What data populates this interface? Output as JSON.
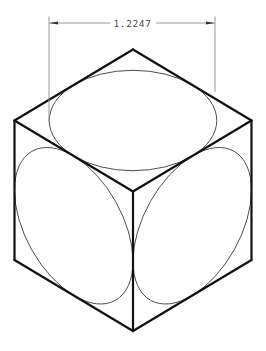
{
  "drawing": {
    "description": "Isometric unit cube with inscribed circles on three visible faces and a linear dimension across the top ellipse major axis",
    "colors": {
      "background": "#ffffff",
      "edge": "#111111",
      "ellipse": "#4d4d4d",
      "dim_line": "#8f8f8f",
      "dim_arrow": "#333333",
      "dim_text": "#4a4a4a"
    },
    "cube": {
      "stroke_width": 2.2,
      "vertices": {
        "top": [
          133,
          49.5
        ],
        "right": [
          251.5,
          120.5
        ],
        "bottom_right": [
          251.5,
          260
        ],
        "bottom": [
          133,
          331
        ],
        "bottom_left": [
          14.5,
          260
        ],
        "left": [
          14.5,
          120.5
        ],
        "center": [
          133,
          191.5
        ]
      },
      "edges": [
        [
          "top",
          "right"
        ],
        [
          "right",
          "bottom_right"
        ],
        [
          "bottom_right",
          "bottom"
        ],
        [
          "bottom",
          "bottom_left"
        ],
        [
          "bottom_left",
          "left"
        ],
        [
          "left",
          "top"
        ],
        [
          "left",
          "center"
        ],
        [
          "right",
          "center"
        ],
        [
          "center",
          "bottom"
        ]
      ]
    },
    "faces": [
      {
        "name": "top-face-ellipse",
        "matrix": [
          118.5,
          -71,
          118.5,
          71,
          133,
          120.5
        ]
      },
      {
        "name": "left-face-ellipse",
        "matrix": [
          118.5,
          71,
          0,
          139.5,
          73.75,
          225.75
        ]
      },
      {
        "name": "right-face-ellipse",
        "matrix": [
          118.5,
          -71,
          0,
          139.5,
          192.25,
          225.75
        ]
      }
    ],
    "dimension": {
      "label": "1.2247",
      "extension_lines": [
        [
          49,
          16.5,
          49,
          122
        ],
        [
          215,
          16.5,
          215,
          92
        ]
      ],
      "dim_lines": [
        [
          49.5,
          23,
          110,
          23
        ],
        [
          156,
          23,
          214.5,
          23
        ]
      ],
      "arrowheads": [
        "49,23 58,21.4 58,24.6",
        "215,23 206,21.4 206,24.6"
      ]
    }
  }
}
